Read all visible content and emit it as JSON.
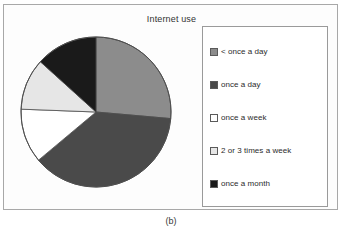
{
  "figure": {
    "caption": "(b)",
    "title": "Internet use"
  },
  "legend": {
    "items": [
      {
        "label": "< once a day",
        "color": "#8c8c8c"
      },
      {
        "label": "once a day",
        "color": "#4a4a4a"
      },
      {
        "label": "once a week",
        "color": "#ffffff"
      },
      {
        "label": "2 or 3 times a week",
        "color": "#e6e6e6"
      },
      {
        "label": "once a month",
        "color": "#1a1a1a"
      }
    ]
  },
  "chart_data": {
    "type": "pie",
    "title": "Internet use",
    "xlabel": "",
    "ylabel": "",
    "categories": [
      "< once a day",
      "once a day",
      "once a week",
      "2 or 3 times a week",
      "once a month"
    ],
    "values": [
      26.4,
      37.5,
      11.7,
      11.1,
      13.3
    ],
    "unit": "percent",
    "colors": [
      "#8c8c8c",
      "#4a4a4a",
      "#ffffff",
      "#e6e6e6",
      "#1a1a1a"
    ],
    "start_angle_deg": 0,
    "direction": "clockwise",
    "slice_angles_deg": [
      95,
      135,
      42,
      40,
      48
    ],
    "legend_position": "right",
    "grid": false,
    "data_labels_shown": false
  }
}
